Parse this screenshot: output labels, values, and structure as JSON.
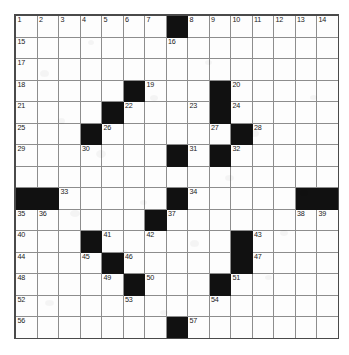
{
  "puzzle": {
    "kind": "crossword-grid",
    "size": {
      "rows": 15,
      "cols": 15
    },
    "colors": {
      "fill": "#fdfdfd",
      "block": "#111111",
      "line": "#8d8d8d",
      "border": "#4a4a4a",
      "number": "#1a1a1a"
    },
    "blocks": [
      [
        1,
        8
      ],
      [
        4,
        6
      ],
      [
        4,
        10
      ],
      [
        5,
        5
      ],
      [
        5,
        10
      ],
      [
        6,
        4
      ],
      [
        6,
        11
      ],
      [
        7,
        8
      ],
      [
        7,
        10
      ],
      [
        9,
        1
      ],
      [
        9,
        2
      ],
      [
        9,
        8
      ],
      [
        9,
        14
      ],
      [
        9,
        15
      ],
      [
        10,
        7
      ],
      [
        11,
        4
      ],
      [
        11,
        11
      ],
      [
        12,
        5
      ],
      [
        12,
        11
      ],
      [
        13,
        6
      ],
      [
        13,
        10
      ],
      [
        16,
        8
      ]
    ],
    "numbers": [
      {
        "r": 1,
        "c": 1,
        "n": "1"
      },
      {
        "r": 1,
        "c": 2,
        "n": "2"
      },
      {
        "r": 1,
        "c": 3,
        "n": "3"
      },
      {
        "r": 1,
        "c": 4,
        "n": "4"
      },
      {
        "r": 1,
        "c": 5,
        "n": "5"
      },
      {
        "r": 1,
        "c": 6,
        "n": "6"
      },
      {
        "r": 1,
        "c": 7,
        "n": "7"
      },
      {
        "r": 1,
        "c": 9,
        "n": "8"
      },
      {
        "r": 1,
        "c": 10,
        "n": "9"
      },
      {
        "r": 1,
        "c": 11,
        "n": "10"
      },
      {
        "r": 1,
        "c": 12,
        "n": "11"
      },
      {
        "r": 1,
        "c": 13,
        "n": "12"
      },
      {
        "r": 1,
        "c": 14,
        "n": "13"
      },
      {
        "r": 1,
        "c": 15,
        "n": "14"
      },
      {
        "r": 2,
        "c": 1,
        "n": "15"
      },
      {
        "r": 2,
        "c": 8,
        "n": "16"
      },
      {
        "r": 3,
        "c": 1,
        "n": "17"
      },
      {
        "r": 4,
        "c": 1,
        "n": "18"
      },
      {
        "r": 4,
        "c": 7,
        "n": "19"
      },
      {
        "r": 4,
        "c": 11,
        "n": "20"
      },
      {
        "r": 5,
        "c": 1,
        "n": "21"
      },
      {
        "r": 5,
        "c": 6,
        "n": "22"
      },
      {
        "r": 5,
        "c": 9,
        "n": "23"
      },
      {
        "r": 5,
        "c": 11,
        "n": "24"
      },
      {
        "r": 6,
        "c": 1,
        "n": "25"
      },
      {
        "r": 6,
        "c": 5,
        "n": "26"
      },
      {
        "r": 6,
        "c": 10,
        "n": "27"
      },
      {
        "r": 6,
        "c": 12,
        "n": "28"
      },
      {
        "r": 7,
        "c": 1,
        "n": "29"
      },
      {
        "r": 7,
        "c": 4,
        "n": "30"
      },
      {
        "r": 7,
        "c": 9,
        "n": "31"
      },
      {
        "r": 7,
        "c": 11,
        "n": "32"
      },
      {
        "r": 9,
        "c": 3,
        "n": "33"
      },
      {
        "r": 9,
        "c": 9,
        "n": "34"
      },
      {
        "r": 10,
        "c": 1,
        "n": "35"
      },
      {
        "r": 10,
        "c": 2,
        "n": "36"
      },
      {
        "r": 10,
        "c": 8,
        "n": "37"
      },
      {
        "r": 10,
        "c": 14,
        "n": "38"
      },
      {
        "r": 10,
        "c": 15,
        "n": "39"
      },
      {
        "r": 11,
        "c": 1,
        "n": "40"
      },
      {
        "r": 11,
        "c": 5,
        "n": "41"
      },
      {
        "r": 11,
        "c": 7,
        "n": "42"
      },
      {
        "r": 11,
        "c": 12,
        "n": "43"
      },
      {
        "r": 12,
        "c": 1,
        "n": "44"
      },
      {
        "r": 12,
        "c": 4,
        "n": "45"
      },
      {
        "r": 12,
        "c": 6,
        "n": "46"
      },
      {
        "r": 12,
        "c": 12,
        "n": "47"
      },
      {
        "r": 13,
        "c": 1,
        "n": "48"
      },
      {
        "r": 13,
        "c": 5,
        "n": "49"
      },
      {
        "r": 13,
        "c": 7,
        "n": "50"
      },
      {
        "r": 13,
        "c": 11,
        "n": "51"
      },
      {
        "r": 14,
        "c": 1,
        "n": "52"
      },
      {
        "r": 14,
        "c": 6,
        "n": "53"
      },
      {
        "r": 14,
        "c": 10,
        "n": "54"
      },
      {
        "r": 15,
        "c": 1,
        "n": "55"
      },
      {
        "r": 16,
        "c": 1,
        "n": "56"
      },
      {
        "r": 16,
        "c": 9,
        "n": "57"
      }
    ]
  }
}
